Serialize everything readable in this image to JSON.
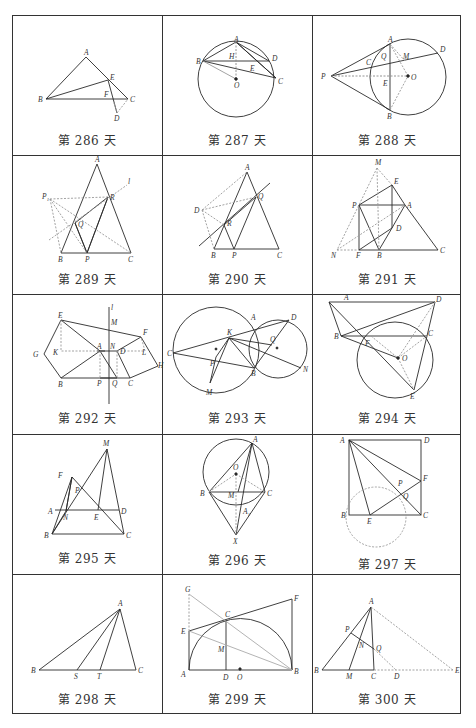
{
  "grid": {
    "rows": 5,
    "cols": 3,
    "border_color": "#333333",
    "line_color": "#2a2a2a",
    "dashed_color": "#9a9a9a"
  },
  "cells": [
    {
      "day": 286,
      "caption": "第 286 天",
      "labels": [
        "A",
        "B",
        "C",
        "D",
        "E",
        "F"
      ]
    },
    {
      "day": 287,
      "caption": "第 287 天",
      "labels": [
        "A",
        "B",
        "C",
        "D",
        "E",
        "H",
        "O"
      ]
    },
    {
      "day": 288,
      "caption": "第 288 天",
      "labels": [
        "A",
        "B",
        "C",
        "D",
        "E",
        "M",
        "O",
        "P",
        "Q"
      ]
    },
    {
      "day": 289,
      "caption": "第 289 天",
      "labels": [
        "A",
        "B",
        "C",
        "P",
        "Q",
        "R",
        "P1",
        "l"
      ]
    },
    {
      "day": 290,
      "caption": "第 290 天",
      "labels": [
        "A",
        "B",
        "C",
        "D",
        "P",
        "Q",
        "R"
      ]
    },
    {
      "day": 291,
      "caption": "第 291 天",
      "labels": [
        "A",
        "B",
        "C",
        "D",
        "E",
        "F",
        "M",
        "N",
        "P"
      ]
    },
    {
      "day": 292,
      "caption": "第 292 天",
      "labels": [
        "A",
        "B",
        "C",
        "D",
        "E",
        "F",
        "G",
        "H",
        "K",
        "L",
        "M",
        "N",
        "P",
        "Q",
        "l"
      ]
    },
    {
      "day": 293,
      "caption": "第 293 天",
      "labels": [
        "A",
        "B",
        "C",
        "D",
        "K",
        "M",
        "N",
        "P",
        "Q"
      ]
    },
    {
      "day": 294,
      "caption": "第 294 天",
      "labels": [
        "A",
        "B",
        "C",
        "D",
        "E",
        "F",
        "O"
      ]
    },
    {
      "day": 295,
      "caption": "第 295 天",
      "labels": [
        "A",
        "B",
        "C",
        "D",
        "E",
        "F",
        "M",
        "N",
        "P"
      ]
    },
    {
      "day": 296,
      "caption": "第 296 天",
      "labels": [
        "A",
        "B",
        "C",
        "M",
        "O",
        "A1",
        "X"
      ]
    },
    {
      "day": 297,
      "caption": "第 297 天",
      "labels": [
        "A",
        "B",
        "C",
        "D",
        "E",
        "F",
        "P",
        "Q"
      ]
    },
    {
      "day": 298,
      "caption": "第 298 天",
      "labels": [
        "A",
        "B",
        "C",
        "S",
        "T"
      ]
    },
    {
      "day": 299,
      "caption": "第 299 天",
      "labels": [
        "A",
        "B",
        "C",
        "D",
        "E",
        "F",
        "G",
        "M",
        "O"
      ]
    },
    {
      "day": 300,
      "caption": "第 300 天",
      "labels": [
        "A",
        "B",
        "C",
        "D",
        "E",
        "M",
        "N",
        "P",
        "Q"
      ]
    }
  ]
}
